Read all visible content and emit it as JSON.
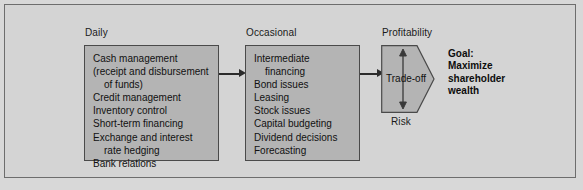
{
  "figure": {
    "background_color": "#d4d4d4",
    "panel_fill_color": "#b4b4b4",
    "panel_border_color": "#4a4a4a",
    "text_color": "#111111"
  },
  "daily": {
    "caption": "Daily",
    "items": [
      {
        "text": "Cash management",
        "indent": false
      },
      {
        "text": "(receipt and disbursement",
        "indent": false
      },
      {
        "text": "of funds)",
        "indent": true
      },
      {
        "text": "Credit management",
        "indent": false
      },
      {
        "text": "Inventory control",
        "indent": false
      },
      {
        "text": "Short-term financing",
        "indent": false
      },
      {
        "text": "Exchange and interest",
        "indent": false
      },
      {
        "text": "rate hedging",
        "indent": true
      },
      {
        "text": "Bank relations",
        "indent": false
      }
    ]
  },
  "occasional": {
    "caption": "Occasional",
    "items": [
      {
        "text": "Intermediate",
        "indent": false
      },
      {
        "text": "financing",
        "indent": true
      },
      {
        "text": "Bond issues",
        "indent": false
      },
      {
        "text": "Leasing",
        "indent": false
      },
      {
        "text": "Stock issues",
        "indent": false
      },
      {
        "text": "Capital budgeting",
        "indent": false
      },
      {
        "text": "Dividend decisions",
        "indent": false
      },
      {
        "text": "Forecasting",
        "indent": false
      }
    ]
  },
  "tradeoff": {
    "top_caption": "Profitability",
    "bottom_caption": "Risk",
    "label": "Trade-off",
    "fill_color": "#b4b4b4",
    "border_color": "#4a4a4a"
  },
  "goal": {
    "lines": [
      "Goal:",
      "Maximize",
      "shareholder",
      "wealth"
    ]
  },
  "arrows": {
    "daily_to_occasional": "arrow-right",
    "occasional_to_tradeoff": "arrow-right",
    "profitability_risk": "double-headed-vertical-arrow"
  }
}
